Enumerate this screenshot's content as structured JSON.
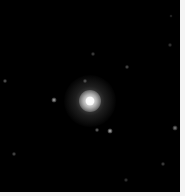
{
  "image": {
    "background_color": "#000000",
    "border_color": "#f4f4f4",
    "main_source": {
      "x": 90,
      "y": 101,
      "core_color": "#ffffff",
      "halo_radius": 26
    },
    "point_sources": [
      {
        "x": 54,
        "y": 100,
        "size": 2,
        "brightness": 0.7
      },
      {
        "x": 110,
        "y": 131,
        "size": 2,
        "brightness": 0.75
      },
      {
        "x": 97,
        "y": 130,
        "size": 1.5,
        "brightness": 0.45
      },
      {
        "x": 175,
        "y": 128,
        "size": 2,
        "brightness": 0.55
      },
      {
        "x": 5,
        "y": 81,
        "size": 1.5,
        "brightness": 0.4
      },
      {
        "x": 127,
        "y": 67,
        "size": 1.5,
        "brightness": 0.35
      },
      {
        "x": 93,
        "y": 54,
        "size": 1.5,
        "brightness": 0.3
      },
      {
        "x": 85,
        "y": 81,
        "size": 1.5,
        "brightness": 0.35
      },
      {
        "x": 14,
        "y": 154,
        "size": 1.5,
        "brightness": 0.35
      },
      {
        "x": 163,
        "y": 164,
        "size": 1.5,
        "brightness": 0.3
      },
      {
        "x": 126,
        "y": 180,
        "size": 1.5,
        "brightness": 0.25
      },
      {
        "x": 170,
        "y": 45,
        "size": 1.5,
        "brightness": 0.25
      },
      {
        "x": 171,
        "y": 16,
        "size": 1,
        "brightness": 0.2
      }
    ]
  }
}
